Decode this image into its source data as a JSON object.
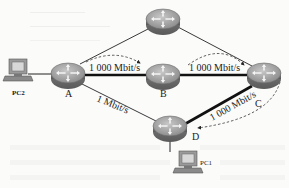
{
  "diagram": {
    "type": "network-topology",
    "nodes": [
      {
        "id": "top",
        "kind": "router",
        "label": ""
      },
      {
        "id": "A",
        "kind": "router",
        "label": "A"
      },
      {
        "id": "B",
        "kind": "router",
        "label": "B"
      },
      {
        "id": "C",
        "kind": "router",
        "label": "C"
      },
      {
        "id": "D",
        "kind": "router",
        "label": "D"
      },
      {
        "id": "PC2",
        "kind": "pc",
        "label": "PC2"
      },
      {
        "id": "PC1",
        "kind": "pc",
        "label": "PC1"
      }
    ],
    "links": [
      {
        "from": "A",
        "to": "B",
        "label": "1 000 Mbit/s",
        "thick": true
      },
      {
        "from": "B",
        "to": "C",
        "label": "1 000 Mbit/s",
        "thick": true
      },
      {
        "from": "C",
        "to": "D",
        "label": "1 000 Mbit/s",
        "thick": true
      },
      {
        "from": "A",
        "to": "D",
        "label": "1 Mbit/s",
        "thick": false
      },
      {
        "from": "A",
        "to": "top",
        "label": "",
        "thick": false
      },
      {
        "from": "top",
        "to": "C",
        "label": "",
        "thick": false
      },
      {
        "from": "PC2",
        "to": "A",
        "label": "",
        "thick": false
      },
      {
        "from": "D",
        "to": "PC1",
        "label": "",
        "thick": false
      }
    ],
    "path_arrows": [
      "A→B (dashed)",
      "B→C (dashed)",
      "C→D (dashed)"
    ],
    "labels": {
      "link_ab": "1 000 Mbit/s",
      "link_bc": "1 000 Mbit/s",
      "link_cd": "1 000 Mbit/s",
      "link_ad": "1 Mbit/s",
      "node_a": "A",
      "node_b": "B",
      "node_c": "C",
      "node_d": "D",
      "pc2": "PC2",
      "pc1": "PC1"
    },
    "colors": {
      "router_body": "#8a8a8a",
      "router_top": "#b4b4b4",
      "link": "#111111",
      "background": "#fbfbfa"
    }
  }
}
